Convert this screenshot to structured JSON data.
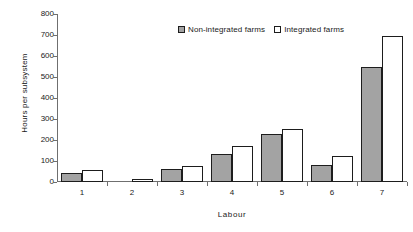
{
  "chart_data": {
    "type": "bar",
    "title": "",
    "subtitle": "",
    "xlabel": "Labour",
    "ylabel": "Hours per subsystem",
    "categories": [
      "1",
      "2",
      "3",
      "4",
      "5",
      "6",
      "7"
    ],
    "series": [
      {
        "name": "Non-integrated farms",
        "color": "#a3a3a3",
        "values": [
          45,
          0,
          60,
          135,
          228,
          80,
          550
        ]
      },
      {
        "name": "Integrated farms",
        "color": "#ffffff",
        "values": [
          58,
          15,
          76,
          172,
          252,
          123,
          695
        ]
      }
    ],
    "ylim": [
      0,
      800
    ],
    "ytick_values": [
      0,
      100,
      200,
      300,
      400,
      500,
      600,
      700,
      800
    ],
    "ytick_labels": [
      "0",
      "100",
      "200",
      "300",
      "400",
      "500",
      "600",
      "700",
      "800"
    ],
    "grid": false,
    "legend_position": "top-center",
    "axis_color": "#6f6f6f",
    "bar_edge_color": "#1d1d1d"
  }
}
